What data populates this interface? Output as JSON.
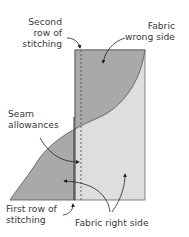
{
  "diagram": {
    "labels": {
      "second_row": [
        "Second",
        "row of",
        "stitching"
      ],
      "wrong_side": [
        "Fabric",
        "wrong side"
      ],
      "seam_allowances": [
        "Seam",
        "allowances"
      ],
      "first_row": [
        "First row of",
        "stitching"
      ],
      "right_side": "Fabric right side"
    },
    "colors": {
      "wrong_side_fill": "#a9a9a9",
      "right_side_fill": "#dedede",
      "outline": "#555555",
      "text": "#3a3a3a"
    }
  }
}
